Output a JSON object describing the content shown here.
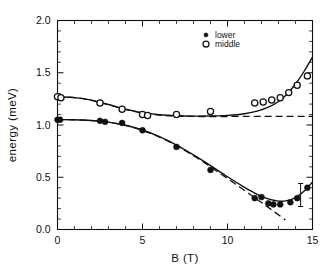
{
  "chart_data": {
    "type": "scatter",
    "title": "",
    "xlabel": "B (T)",
    "ylabel": "energy (meV)",
    "xlim": [
      0,
      15
    ],
    "ylim": [
      0.0,
      2.0
    ],
    "xticks": [
      0,
      5,
      10,
      15
    ],
    "xtick_labels": [
      "0",
      "5",
      "10",
      "15"
    ],
    "yticks": [
      0.0,
      0.5,
      1.0,
      1.5,
      2.0
    ],
    "ytick_labels": [
      "0.0",
      "0.5",
      "1.0",
      "1.5",
      "2.0"
    ],
    "x_minor_tick_step": 1,
    "y_minor_tick_step": 0.1,
    "grid": false,
    "legend_position": "upper right",
    "series": [
      {
        "name": "lower",
        "marker": "filled-circle",
        "points": [
          {
            "x": 0.0,
            "y": 1.05
          },
          {
            "x": 0.15,
            "y": 1.05
          },
          {
            "x": 2.5,
            "y": 1.04
          },
          {
            "x": 2.8,
            "y": 1.03
          },
          {
            "x": 3.8,
            "y": 1.02
          },
          {
            "x": 5.0,
            "y": 0.95
          },
          {
            "x": 7.0,
            "y": 0.79
          },
          {
            "x": 9.0,
            "y": 0.57
          },
          {
            "x": 11.6,
            "y": 0.3
          },
          {
            "x": 12.0,
            "y": 0.31
          },
          {
            "x": 12.4,
            "y": 0.25
          },
          {
            "x": 12.7,
            "y": 0.24
          },
          {
            "x": 13.1,
            "y": 0.24
          },
          {
            "x": 13.7,
            "y": 0.26
          },
          {
            "x": 14.1,
            "y": 0.3
          },
          {
            "x": 14.7,
            "y": 0.4
          }
        ],
        "error_bars": [
          {
            "x": 14.3,
            "y": 0.33,
            "yerr": 0.11
          }
        ]
      },
      {
        "name": "middle",
        "marker": "open-circle",
        "points": [
          {
            "x": 0.0,
            "y": 1.27
          },
          {
            "x": 0.2,
            "y": 1.26
          },
          {
            "x": 2.5,
            "y": 1.21
          },
          {
            "x": 3.8,
            "y": 1.15
          },
          {
            "x": 5.0,
            "y": 1.1
          },
          {
            "x": 5.3,
            "y": 1.09
          },
          {
            "x": 7.0,
            "y": 1.1
          },
          {
            "x": 9.0,
            "y": 1.13
          },
          {
            "x": 11.6,
            "y": 1.21
          },
          {
            "x": 12.1,
            "y": 1.22
          },
          {
            "x": 12.6,
            "y": 1.24
          },
          {
            "x": 13.1,
            "y": 1.26
          },
          {
            "x": 13.6,
            "y": 1.31
          },
          {
            "x": 14.1,
            "y": 1.38
          },
          {
            "x": 14.7,
            "y": 1.47
          }
        ],
        "error_bars": []
      }
    ],
    "fit_curves": [
      {
        "name": "lower-fit",
        "style": "solid",
        "points": [
          {
            "x": 0.0,
            "y": 1.052
          },
          {
            "x": 1.0,
            "y": 1.05
          },
          {
            "x": 2.0,
            "y": 1.043
          },
          {
            "x": 3.0,
            "y": 1.028
          },
          {
            "x": 4.0,
            "y": 0.998
          },
          {
            "x": 5.0,
            "y": 0.952
          },
          {
            "x": 6.0,
            "y": 0.888
          },
          {
            "x": 7.0,
            "y": 0.808
          },
          {
            "x": 8.0,
            "y": 0.714
          },
          {
            "x": 9.0,
            "y": 0.612
          },
          {
            "x": 10.0,
            "y": 0.505
          },
          {
            "x": 11.0,
            "y": 0.404
          },
          {
            "x": 11.5,
            "y": 0.358
          },
          {
            "x": 12.0,
            "y": 0.317
          },
          {
            "x": 12.5,
            "y": 0.288
          },
          {
            "x": 13.0,
            "y": 0.272
          },
          {
            "x": 13.5,
            "y": 0.276
          },
          {
            "x": 14.0,
            "y": 0.305
          },
          {
            "x": 14.5,
            "y": 0.365
          },
          {
            "x": 15.0,
            "y": 0.455
          }
        ]
      },
      {
        "name": "lower-asymptote",
        "style": "dashed",
        "points": [
          {
            "x": 0.0,
            "y": 1.052
          },
          {
            "x": 2.0,
            "y": 1.042
          },
          {
            "x": 4.0,
            "y": 0.996
          },
          {
            "x": 6.0,
            "y": 0.884
          },
          {
            "x": 8.0,
            "y": 0.706
          },
          {
            "x": 10.0,
            "y": 0.488
          },
          {
            "x": 11.5,
            "y": 0.316
          },
          {
            "x": 12.5,
            "y": 0.2
          },
          {
            "x": 13.4,
            "y": 0.092
          }
        ]
      },
      {
        "name": "middle-fit",
        "style": "solid",
        "points": [
          {
            "x": 0.0,
            "y": 1.268
          },
          {
            "x": 1.0,
            "y": 1.262
          },
          {
            "x": 2.0,
            "y": 1.238
          },
          {
            "x": 3.0,
            "y": 1.196
          },
          {
            "x": 4.0,
            "y": 1.152
          },
          {
            "x": 5.0,
            "y": 1.118
          },
          {
            "x": 6.0,
            "y": 1.098
          },
          {
            "x": 7.0,
            "y": 1.088
          },
          {
            "x": 8.0,
            "y": 1.085
          },
          {
            "x": 9.0,
            "y": 1.086
          },
          {
            "x": 10.0,
            "y": 1.092
          },
          {
            "x": 11.0,
            "y": 1.108
          },
          {
            "x": 11.8,
            "y": 1.135
          },
          {
            "x": 12.5,
            "y": 1.178
          },
          {
            "x": 13.0,
            "y": 1.225
          },
          {
            "x": 13.5,
            "y": 1.295
          },
          {
            "x": 14.0,
            "y": 1.392
          },
          {
            "x": 14.5,
            "y": 1.512
          },
          {
            "x": 15.0,
            "y": 1.65
          }
        ]
      },
      {
        "name": "middle-asymptote",
        "style": "dashed",
        "points": [
          {
            "x": 0.0,
            "y": 1.272
          },
          {
            "x": 1.5,
            "y": 1.252
          },
          {
            "x": 3.0,
            "y": 1.192
          },
          {
            "x": 4.5,
            "y": 1.13
          },
          {
            "x": 6.0,
            "y": 1.094
          },
          {
            "x": 8.0,
            "y": 1.082
          },
          {
            "x": 11.0,
            "y": 1.082
          },
          {
            "x": 13.5,
            "y": 1.082
          },
          {
            "x": 15.0,
            "y": 1.082
          }
        ]
      }
    ]
  },
  "legend": {
    "entries": [
      {
        "label": "lower",
        "marker": "filled-circle"
      },
      {
        "label": "middle",
        "marker": "open-circle"
      }
    ]
  },
  "style": {
    "ink": "#111111",
    "background": "#ffffff",
    "marker_fill_open": "#ffffff"
  }
}
